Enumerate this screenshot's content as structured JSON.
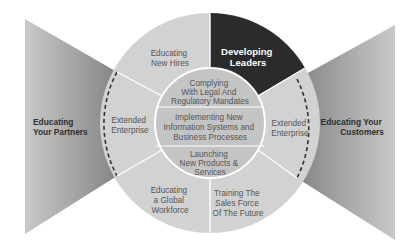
{
  "diagram": {
    "center": "Training program circle",
    "outer_ring": [
      {
        "id": "educating-new-hires",
        "lines": [
          "Educating",
          "New Hires"
        ]
      },
      {
        "id": "developing-leaders",
        "lines": [
          "Developing",
          "Leaders"
        ],
        "highlighted": true
      },
      {
        "id": "extended-enterprise-right",
        "lines": [
          "Extended",
          "Enterprise"
        ]
      },
      {
        "id": "training-sales-force",
        "lines": [
          "Training The",
          "Sales Force",
          "Of The Future"
        ]
      },
      {
        "id": "educating-global-workforce",
        "lines": [
          "Educating",
          "a Global",
          "Workforce"
        ]
      },
      {
        "id": "extended-enterprise-left",
        "lines": [
          "Extended",
          "Enterprise"
        ]
      }
    ],
    "inner_circle": [
      {
        "id": "complying",
        "lines": [
          "Complying",
          "With Legal And",
          "Regulatory Mandates"
        ]
      },
      {
        "id": "implementing",
        "lines": [
          "Implementing New",
          "Information Systems and",
          "Business Processes"
        ]
      },
      {
        "id": "launching",
        "lines": [
          "Launching",
          "New Products &",
          "Services"
        ]
      }
    ],
    "wedges": {
      "left": {
        "lines": [
          "Educating",
          "Your Partners"
        ]
      },
      "right": {
        "lines": [
          "Educating Your",
          "Customers"
        ]
      }
    },
    "colors": {
      "ring_fill": "#d2d2d2",
      "inner_fill": "#c4c4c4",
      "highlight_fill": "#2b2b2b",
      "wedge_light": "#c8c8c8",
      "wedge_dark": "#8a8a8a",
      "divider": "#ffffff"
    }
  }
}
